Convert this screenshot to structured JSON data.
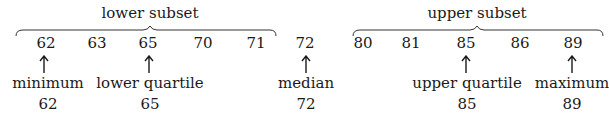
{
  "diagram": {
    "lower_subset": {
      "title": "lower subset",
      "values": [
        "62",
        "63",
        "65",
        "70",
        "71"
      ]
    },
    "median_value": "72",
    "upper_subset": {
      "title": "upper subset",
      "values": [
        "80",
        "81",
        "85",
        "86",
        "89"
      ]
    },
    "markers": [
      {
        "label": "minimum",
        "value": "62"
      },
      {
        "label": "lower quartile",
        "value": "65"
      },
      {
        "label": "median",
        "value": "72"
      },
      {
        "label": "upper quartile",
        "value": "85"
      },
      {
        "label": "maximum",
        "value": "89"
      }
    ]
  }
}
